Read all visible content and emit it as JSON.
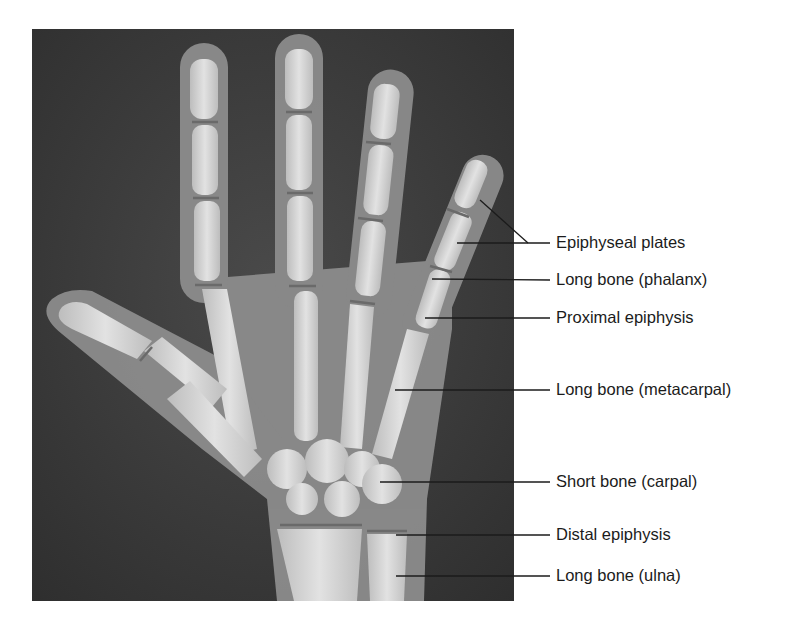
{
  "figure": {
    "image_alt": "Radiograph of a child's hand showing bones and growth plates",
    "colors": {
      "background": "#ffffff",
      "film_dark": "#3a3a3a",
      "soft_tissue": "#8a8a8a",
      "bone": "#d6d6d6",
      "label_text": "#1b1b1b",
      "leader_line": "#1b1b1b"
    }
  },
  "labels": [
    {
      "text": "Epiphyseal plates",
      "y": 243
    },
    {
      "text": "Long bone (phalanx)",
      "y": 280
    },
    {
      "text": "Proximal epiphysis",
      "y": 318
    },
    {
      "text": "Long bone (metacarpal)",
      "y": 390
    },
    {
      "text": "Short bone (carpal)",
      "y": 482
    },
    {
      "text": "Distal epiphysis",
      "y": 535
    },
    {
      "text": "Long bone (ulna)",
      "y": 576
    }
  ]
}
